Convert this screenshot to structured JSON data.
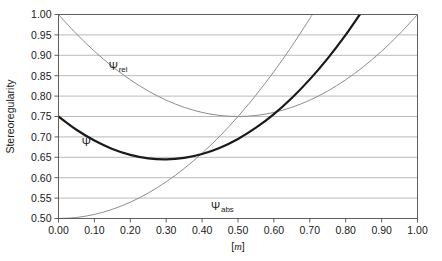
{
  "chart_data": {
    "type": "line",
    "title": "",
    "xlabel": "[m]",
    "ylabel": "Stereoregularity",
    "xlim": [
      0.0,
      1.0
    ],
    "ylim": [
      0.5,
      1.0
    ],
    "grid": "horizontal",
    "legend_position": "inline-annotations",
    "x_ticks": [
      "0.00",
      "0.10",
      "0.20",
      "0.30",
      "0.40",
      "0.50",
      "0.60",
      "0.70",
      "0.80",
      "0.90",
      "1.00"
    ],
    "x_tick_values": [
      0.0,
      0.1,
      0.2,
      0.3,
      0.4,
      0.5,
      0.6,
      0.7,
      0.8,
      0.9,
      1.0
    ],
    "y_ticks": [
      "0.50",
      "0.55",
      "0.60",
      "0.65",
      "0.70",
      "0.75",
      "0.80",
      "0.85",
      "0.90",
      "0.95",
      "1.00"
    ],
    "y_tick_values": [
      0.5,
      0.55,
      0.6,
      0.65,
      0.7,
      0.75,
      0.8,
      0.85,
      0.9,
      0.95,
      1.0
    ],
    "x": [
      0.0,
      0.05,
      0.1,
      0.15,
      0.2,
      0.25,
      0.3,
      0.35,
      0.4,
      0.45,
      0.5,
      0.55,
      0.6,
      0.65,
      0.7,
      0.75,
      0.8,
      0.85,
      0.9,
      0.95,
      1.0
    ],
    "series": [
      {
        "name": "psi_rel",
        "label": "Ψ",
        "subscript": "rel",
        "color": "#8c8c8c",
        "width": 1.0,
        "label_x": 0.14,
        "label_y": 0.865,
        "values": [
          1.0,
          0.9525,
          0.91,
          0.8725,
          0.84,
          0.8125,
          0.79,
          0.7725,
          0.76,
          0.7525,
          0.75,
          0.7525,
          0.76,
          0.7725,
          0.79,
          0.8125,
          0.84,
          0.8725,
          0.91,
          0.9525,
          1.0
        ]
      },
      {
        "name": "psi_abs",
        "label": "Ψ",
        "subscript": "abs",
        "color": "#8c8c8c",
        "width": 1.0,
        "label_x": 0.425,
        "label_y": 0.522,
        "values": [
          0.5,
          0.5025,
          0.51,
          0.5225,
          0.54,
          0.5625,
          0.59,
          0.6225,
          0.66,
          0.7025,
          0.75,
          0.8025,
          0.86,
          0.9225,
          0.99,
          1.0625,
          1.14,
          1.2225,
          1.31,
          1.4025,
          1.5
        ]
      },
      {
        "name": "psi",
        "label": "Ψ",
        "subscript": "",
        "color": "#1a1a1a",
        "width": 2.2,
        "label_x": 0.065,
        "label_y": 0.678,
        "values": [
          0.75,
          0.7175,
          0.691,
          0.6705,
          0.656,
          0.6475,
          0.645,
          0.6485,
          0.658,
          0.6735,
          0.695,
          0.7225,
          0.756,
          0.7955,
          0.841,
          0.8925,
          0.95,
          1.0135,
          1.083,
          1.1585,
          1.24
        ]
      }
    ],
    "notes": {
      "psi_rel_formula": "relative curve, parabolic minimum 0.75 at m=0.50, endpoints 1.00",
      "psi_abs_formula": "absolute curve, 0.50 at m=0.00 rising to 1.00 at m=1.00",
      "psi_formula": "combined curve, 0.75 at m=0.00, minimum ~0.605 near m=0.35, 1.00 at m=1.00"
    }
  },
  "axes": {
    "y_axis_title": "Stereoregularity",
    "x_axis_unit_open": "[",
    "x_axis_unit_symbol": "m",
    "x_axis_unit_close": "]"
  },
  "colors": {
    "background": "#ffffff",
    "plot_background": "#ffffff",
    "gridline": "#a8a8a8",
    "axis_line": "#4d4d4d",
    "text": "#1a1a1a",
    "curve_light": "#8c8c8c",
    "curve_dark": "#1a1a1a"
  }
}
